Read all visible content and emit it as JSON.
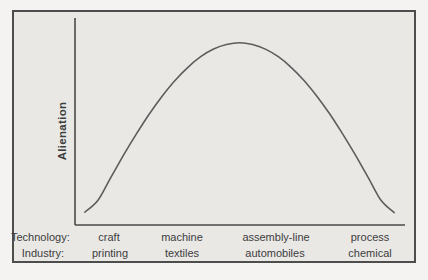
{
  "figure": {
    "frame_border_color": "#4d4d4d",
    "frame_background": "#e9e8e5",
    "page_background": "#f4f3f1",
    "text_color": "#3d3d3d"
  },
  "chart_data": {
    "type": "line",
    "title": "",
    "xlabel": "",
    "ylabel": "Alienation",
    "shape": "inverted-U",
    "grid": false,
    "legend": false,
    "y_ticks": [],
    "ylim": [
      0,
      1
    ],
    "categories": [
      "craft",
      "machine",
      "assembly-line",
      "process"
    ],
    "series": [
      {
        "name": "Alienation",
        "values": [
          0.21,
          0.73,
          0.82,
          0.19
        ]
      }
    ],
    "x_label_rows": [
      {
        "label": "Technology:",
        "values": [
          "craft",
          "machine",
          "assembly-line",
          "process"
        ]
      },
      {
        "label": "Industry:",
        "values": [
          "printing",
          "textiles",
          "automobiles",
          "chemical"
        ]
      }
    ],
    "category_x_fraction": [
      0.1,
      0.32,
      0.61,
      0.9
    ],
    "axis_color": "#4a4a4a",
    "curve_color": "#5d5d5d",
    "curve_samples": [
      [
        0.03,
        0.062
      ],
      [
        0.069,
        0.118
      ],
      [
        0.108,
        0.228
      ],
      [
        0.147,
        0.337
      ],
      [
        0.186,
        0.44
      ],
      [
        0.225,
        0.536
      ],
      [
        0.264,
        0.622
      ],
      [
        0.303,
        0.698
      ],
      [
        0.342,
        0.762
      ],
      [
        0.381,
        0.813
      ],
      [
        0.42,
        0.85
      ],
      [
        0.459,
        0.872
      ],
      [
        0.499,
        0.88
      ],
      [
        0.538,
        0.872
      ],
      [
        0.577,
        0.85
      ],
      [
        0.616,
        0.813
      ],
      [
        0.655,
        0.762
      ],
      [
        0.694,
        0.698
      ],
      [
        0.733,
        0.622
      ],
      [
        0.772,
        0.536
      ],
      [
        0.811,
        0.44
      ],
      [
        0.85,
        0.337
      ],
      [
        0.889,
        0.228
      ],
      [
        0.928,
        0.118
      ],
      [
        0.967,
        0.06
      ]
    ]
  }
}
